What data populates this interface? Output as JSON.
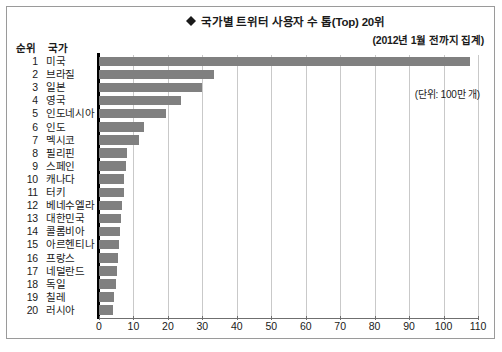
{
  "chart_data": {
    "type": "bar",
    "orientation": "horizontal",
    "title": "국가별 트위터 사용자 수 톱(Top) 20위",
    "subtitle": "(2012년 1월 전까지 집계)",
    "unit_note": "(단위: 100만 개)",
    "xlabel": "",
    "ylabel": "",
    "xlim": [
      0,
      110
    ],
    "xticks": [
      0,
      10,
      20,
      30,
      40,
      50,
      60,
      70,
      80,
      90,
      100,
      110
    ],
    "grid": true,
    "legend": null,
    "bar_color": "#808080",
    "categories": [
      "미국",
      "브라질",
      "일본",
      "영국",
      "인도네시아",
      "인도",
      "멕시코",
      "필리핀",
      "스페인",
      "캐나다",
      "터키",
      "베네수엘라",
      "대한민국",
      "콜롬비아",
      "아르헨티나",
      "프랑스",
      "네덜란드",
      "독일",
      "칠레",
      "러시아"
    ],
    "ranks": [
      1,
      2,
      3,
      4,
      5,
      6,
      7,
      8,
      9,
      10,
      11,
      12,
      13,
      14,
      15,
      16,
      17,
      18,
      19,
      20
    ],
    "values": [
      107.7,
      33.3,
      29.9,
      23.8,
      19.5,
      13.0,
      11.7,
      8.0,
      7.9,
      7.4,
      7.2,
      6.6,
      6.5,
      6.2,
      5.9,
      5.5,
      5.2,
      4.9,
      4.3,
      4.1
    ]
  },
  "table_headers": {
    "rank": "순위",
    "country": "국가"
  },
  "icons": {
    "title_marker": "diamond-icon"
  }
}
